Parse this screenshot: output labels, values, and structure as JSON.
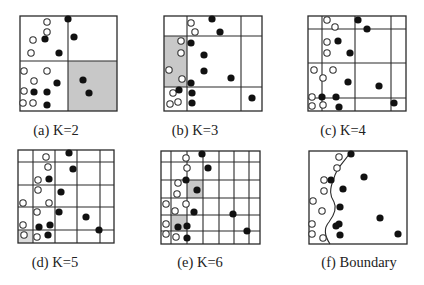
{
  "figure": {
    "colors": {
      "line": "#2a2a2a",
      "shade": "#c8c8c8",
      "shade_light": "#dcdcdc",
      "filled_point": "#111111",
      "open_point_stroke": "#333333",
      "background": "#ffffff"
    },
    "panels": [
      {
        "id": "a",
        "caption": "(a) K=2",
        "box": [
          20,
          16,
          117,
          111
        ],
        "caption_pos": [
          56,
          135
        ],
        "vlines": [
          68
        ],
        "hlines": [
          61
        ],
        "segments": [],
        "shaded": [
          [
            68,
            61,
            117,
            111,
            "shade"
          ]
        ],
        "open": [
          [
            47,
            22
          ],
          [
            47,
            32
          ],
          [
            33,
            40
          ],
          [
            31,
            53
          ],
          [
            24,
            71
          ],
          [
            47,
            71
          ],
          [
            34,
            81
          ],
          [
            24,
            91
          ],
          [
            23,
            103
          ],
          [
            33,
            103
          ]
        ],
        "filled": [
          [
            68,
            19
          ],
          [
            74,
            37
          ],
          [
            45,
            39
          ],
          [
            59,
            53
          ],
          [
            57,
            83
          ],
          [
            83,
            80
          ],
          [
            89,
            93
          ],
          [
            34,
            92
          ],
          [
            47,
            92
          ],
          [
            47,
            105
          ]
        ]
      },
      {
        "id": "b",
        "caption": "(b) K=3",
        "box": [
          164,
          16,
          262,
          111
        ],
        "caption_pos": [
          195,
          135
        ],
        "vlines": [
          187,
          241
        ],
        "hlines": [
          36,
          87
        ],
        "segments": [],
        "shaded": [
          [
            164,
            36,
            187,
            87,
            "shade"
          ]
        ],
        "open": [
          [
            191,
            23
          ],
          [
            195,
            32
          ],
          [
            181,
            41
          ],
          [
            181,
            53
          ],
          [
            169,
            70
          ],
          [
            182,
            79
          ],
          [
            173,
            93
          ],
          [
            170,
            104
          ],
          [
            178,
            102
          ]
        ],
        "filled": [
          [
            212,
            19
          ],
          [
            220,
            32
          ],
          [
            191,
            43
          ],
          [
            204,
            55
          ],
          [
            191,
            83
          ],
          [
            231,
            78
          ],
          [
            204,
            71
          ],
          [
            179,
            90
          ],
          [
            192,
            93
          ],
          [
            192,
            103
          ],
          [
            252,
            98
          ]
        ]
      },
      {
        "id": "c",
        "caption": "(c) K=4",
        "box": [
          308,
          16,
          406,
          111
        ],
        "caption_pos": [
          343,
          135
        ],
        "vlines": [
          322,
          355,
          391
        ],
        "hlines": [
          29,
          63,
          98
        ],
        "segments": [],
        "shaded": [],
        "open": [
          [
            327,
            20
          ],
          [
            335,
            27
          ],
          [
            327,
            42
          ],
          [
            327,
            53
          ],
          [
            314,
            70
          ],
          [
            333,
            70
          ],
          [
            323,
            78
          ],
          [
            312,
            97
          ],
          [
            312,
            106
          ],
          [
            323,
            105
          ]
        ],
        "filled": [
          [
            358,
            20
          ],
          [
            367,
            29
          ],
          [
            338,
            41
          ],
          [
            350,
            53
          ],
          [
            348,
            82
          ],
          [
            379,
            86
          ],
          [
            322,
            97
          ],
          [
            336,
            97
          ],
          [
            339,
            107
          ],
          [
            394,
            103
          ]
        ]
      },
      {
        "id": "d",
        "caption": "(d) K=5",
        "box": [
          18,
          150,
          114,
          243
        ],
        "caption_pos": [
          55,
          267
        ],
        "vlines": [
          33,
          55,
          77,
          100
        ],
        "hlines": [
          162,
          185,
          207,
          230
        ],
        "segments": [],
        "shaded": [
          [
            18,
            230,
            33,
            243,
            "shade_light"
          ]
        ],
        "open": [
          [
            46,
            157
          ],
          [
            48,
            167
          ],
          [
            38,
            180
          ],
          [
            38,
            190
          ],
          [
            23,
            203
          ],
          [
            49,
            203
          ],
          [
            37,
            212
          ],
          [
            23,
            225
          ],
          [
            24,
            235
          ],
          [
            37,
            237
          ]
        ],
        "filled": [
          [
            69,
            153
          ],
          [
            73,
            169
          ],
          [
            49,
            179
          ],
          [
            61,
            192
          ],
          [
            59,
            212
          ],
          [
            86,
            217
          ],
          [
            39,
            227
          ],
          [
            50,
            225
          ],
          [
            48,
            235
          ],
          [
            99,
            230
          ]
        ]
      },
      {
        "id": "e",
        "caption": "(e) K=6",
        "box": [
          161,
          151,
          260,
          244
        ],
        "caption_pos": [
          200,
          267
        ],
        "vlines": [
          171,
          187,
          203,
          219,
          234,
          249
        ],
        "hlines": [
          162,
          180,
          198,
          215,
          231
        ],
        "segments": [],
        "shaded": [
          [
            187,
            180,
            203,
            198,
            "shade"
          ],
          [
            171,
            215,
            187,
            231,
            "shade"
          ]
        ],
        "open": [
          [
            186,
            158
          ],
          [
            187,
            168
          ],
          [
            178,
            183
          ],
          [
            177,
            194
          ],
          [
            166,
            204
          ],
          [
            175,
            211
          ],
          [
            186,
            204
          ],
          [
            166,
            224
          ],
          [
            166,
            234
          ],
          [
            176,
            237
          ]
        ],
        "filled": [
          [
            202,
            154
          ],
          [
            208,
            168
          ],
          [
            186,
            180
          ],
          [
            197,
            190
          ],
          [
            194,
            212
          ],
          [
            233,
            214
          ],
          [
            178,
            227
          ],
          [
            187,
            226
          ],
          [
            187,
            238
          ],
          [
            247,
            231
          ]
        ]
      },
      {
        "id": "f",
        "caption": "(f) Boundary",
        "box": [
          309,
          151,
          407,
          244
        ],
        "caption_pos": [
          359,
          267
        ],
        "vlines": [],
        "hlines": [],
        "segments": [],
        "shaded": [],
        "boundary_path": "M 351 151 C 345 162, 337 166, 334 178 C 329 190, 330 196, 334 202 C 338 210, 332 218, 329 222 C 322 230, 326 238, 330 244",
        "open": [
          [
            339,
            157
          ],
          [
            337,
            168
          ],
          [
            324,
            180
          ],
          [
            324,
            191
          ],
          [
            313,
            201
          ],
          [
            322,
            211
          ],
          [
            312,
            224
          ],
          [
            312,
            234
          ],
          [
            323,
            238
          ]
        ],
        "filled": [
          [
            351,
            154
          ],
          [
            364,
            177
          ],
          [
            331,
            180
          ],
          [
            343,
            189
          ],
          [
            340,
            207
          ],
          [
            339,
            224
          ],
          [
            336,
            226
          ],
          [
            340,
            235
          ],
          [
            380,
            218
          ],
          [
            398,
            234
          ]
        ]
      }
    ]
  }
}
